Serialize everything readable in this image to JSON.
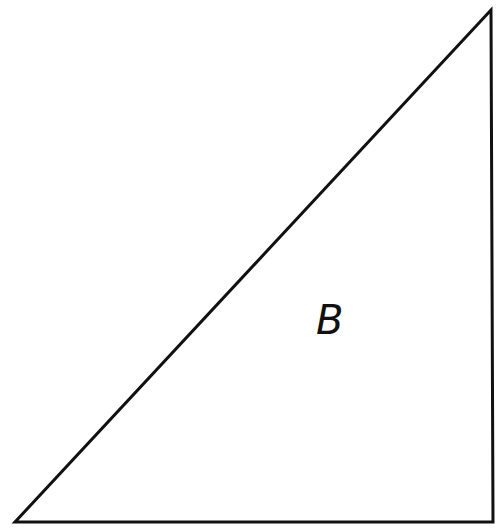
{
  "diagram": {
    "type": "right-triangle",
    "stroke_color": "#111111",
    "fill_color": "#ffffff",
    "vertices": {
      "top": [
        491,
        10
      ],
      "bottom_left": [
        15,
        522
      ],
      "bottom_right": [
        493,
        522
      ]
    },
    "label": {
      "text": "B",
      "x": 316,
      "y": 300
    }
  }
}
